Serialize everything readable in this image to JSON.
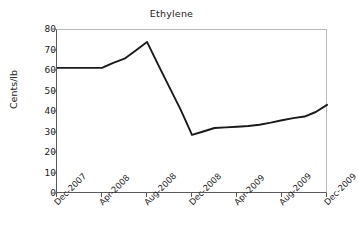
{
  "chart_data": {
    "type": "line",
    "title": "Ethylene",
    "xlabel": "",
    "ylabel": "Cents/lb",
    "ylim": [
      0,
      80
    ],
    "yticks": [
      0,
      10,
      20,
      30,
      40,
      50,
      60,
      70,
      80
    ],
    "xticks": [
      "Dec-2007",
      "Apr-2008",
      "Aug-2008",
      "Dec-2008",
      "Apr-2009",
      "Aug-2009",
      "Dec-2009"
    ],
    "grid": false,
    "legend": false,
    "line_color": "#1a1a1a",
    "x": [
      "Dec-2007",
      "Jan-2008",
      "Feb-2008",
      "Mar-2008",
      "Apr-2008",
      "May-2008",
      "Jun-2008",
      "Jul-2008",
      "Aug-2008",
      "Sep-2008",
      "Oct-2008",
      "Nov-2008",
      "Dec-2008",
      "Jan-2009",
      "Feb-2009",
      "Mar-2009",
      "Apr-2009",
      "May-2009",
      "Jun-2009",
      "Jul-2009",
      "Aug-2009",
      "Sep-2009",
      "Oct-2009",
      "Nov-2009",
      "Dec-2009"
    ],
    "series": [
      {
        "name": "Ethylene",
        "values": [
          61.5,
          61.5,
          61.5,
          61.5,
          61.5,
          64.0,
          66.0,
          70.0,
          74.2,
          63.0,
          52.0,
          41.0,
          28.8,
          30.5,
          32.2,
          32.5,
          32.8,
          33.2,
          33.8,
          34.8,
          36.0,
          37.0,
          37.8,
          40.0,
          43.5
        ]
      }
    ]
  }
}
